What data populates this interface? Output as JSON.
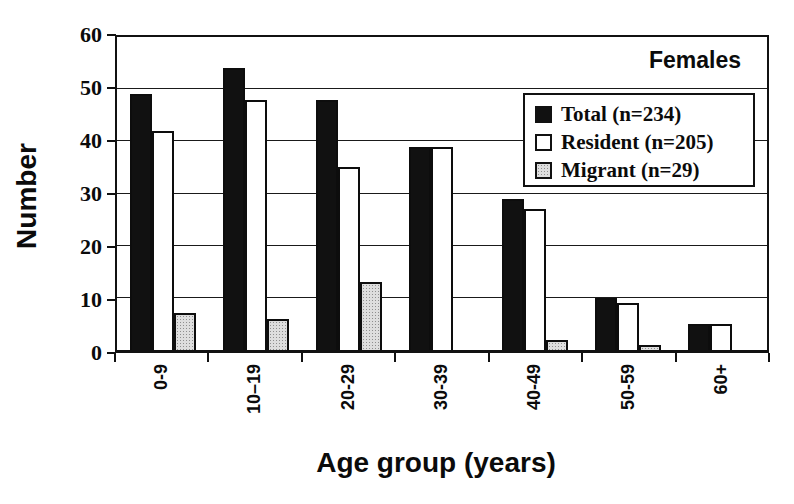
{
  "chart_data": {
    "type": "bar",
    "annotation": "Females",
    "annotation_position": "upper-right-inside",
    "xlabel": "Age group (years)",
    "ylabel": "Number",
    "ylim": [
      0,
      60
    ],
    "yticks": [
      0,
      10,
      20,
      30,
      40,
      50,
      60
    ],
    "grid": true,
    "legend_position": "upper-right-inside",
    "categories": [
      "0-9",
      "10–19",
      "20-29",
      "30-39",
      "40-49",
      "50-59",
      "60+"
    ],
    "series": [
      {
        "name": "Total (n=234)",
        "short_name": "total",
        "n": 234,
        "color": "#111111",
        "pattern": "solid",
        "values": [
          49,
          54,
          48,
          39,
          29,
          10,
          5
        ]
      },
      {
        "name": "Resident (n=205)",
        "short_name": "resident",
        "n": 205,
        "color": "#ffffff",
        "pattern": "solid",
        "values": [
          42,
          48,
          35,
          39,
          27,
          9,
          5
        ]
      },
      {
        "name": "Migrant (n=29)",
        "short_name": "migrant",
        "n": 29,
        "color": "#dedede",
        "pattern": "dotted",
        "values": [
          7,
          6,
          13,
          0,
          2,
          1,
          0
        ]
      }
    ],
    "colors": {
      "axis": "#111111",
      "grid": "#1a1a1a",
      "text": "#0b0b0b",
      "plot_background": "#ffffff"
    }
  }
}
